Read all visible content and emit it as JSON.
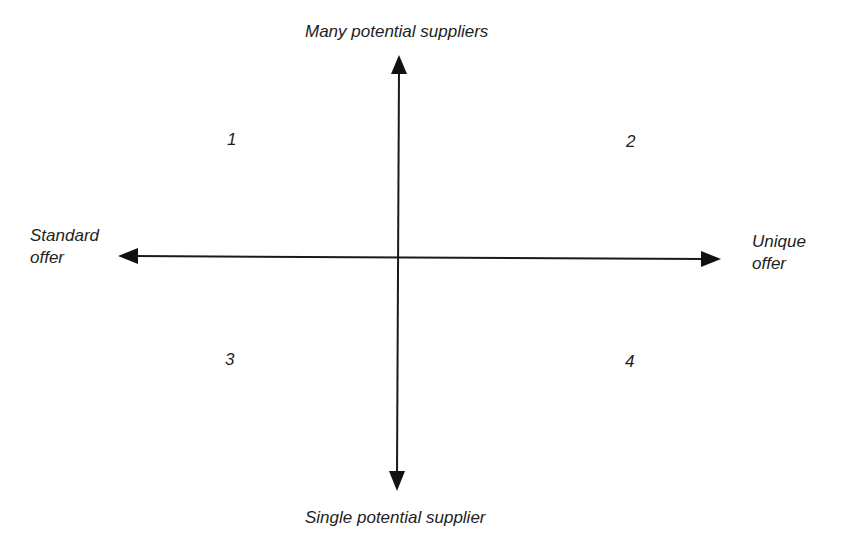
{
  "diagram": {
    "type": "2x2 quadrant matrix",
    "axes": {
      "vertical": {
        "top_label": "Many potential suppliers",
        "bottom_label": "Single potential supplier"
      },
      "horizontal": {
        "left_label_line1": "Standard",
        "left_label_line2": "offer",
        "right_label_line1": "Unique",
        "right_label_line2": "offer"
      }
    },
    "quadrants": [
      {
        "label": "1",
        "position": "top-left"
      },
      {
        "label": "2",
        "position": "top-right"
      },
      {
        "label": "3",
        "position": "bottom-left"
      },
      {
        "label": "4",
        "position": "bottom-right"
      }
    ],
    "colors": {
      "line": "#1a1a1a",
      "background": "#ffffff"
    }
  }
}
